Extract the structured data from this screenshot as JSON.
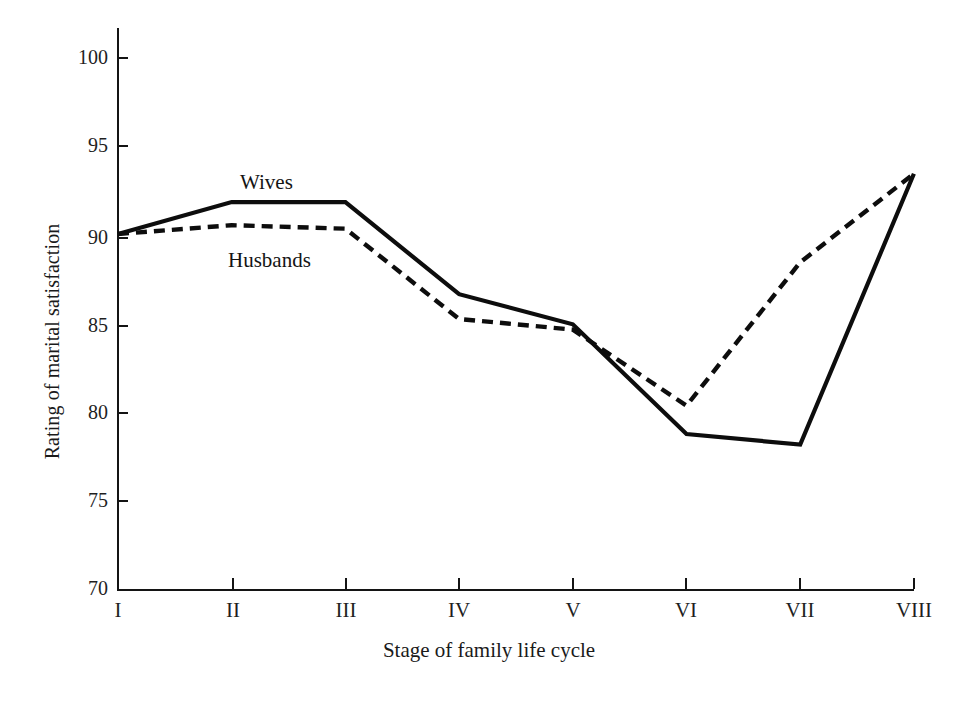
{
  "chart_data": {
    "type": "line",
    "title": "",
    "xlabel": "Stage of family life cycle",
    "ylabel": "Rating of marital satisfaction",
    "categories": [
      "I",
      "II",
      "III",
      "IV",
      "V",
      "VI",
      "VII",
      "VIII"
    ],
    "x_tick_labels": [
      "I",
      "II",
      "III",
      "IV",
      "V",
      "VI",
      "VII",
      "VIII"
    ],
    "y_tick_labels": [
      "100",
      "95",
      "90",
      "85",
      "80",
      "75",
      "70"
    ],
    "y_ticks": [
      100,
      95,
      90,
      85,
      80,
      75,
      70
    ],
    "ylim": [
      70,
      100
    ],
    "grid": false,
    "legend_position": "inline-labels",
    "series": [
      {
        "name": "Wives",
        "style": "solid",
        "color": "#0d0d0d",
        "values": [
          90.0,
          91.8,
          91.8,
          86.6,
          84.9,
          78.7,
          78.1,
          93.4
        ]
      },
      {
        "name": "Husbands",
        "style": "dashed",
        "color": "#0d0d0d",
        "values": [
          90.0,
          90.5,
          90.3,
          85.2,
          84.6,
          80.3,
          88.4,
          93.4
        ]
      }
    ],
    "annotations": [
      {
        "text": "Wives",
        "x_category": "II",
        "value": 91.8
      },
      {
        "text": "Husbands",
        "x_category": "II",
        "value": 90.5
      }
    ]
  },
  "axis": {
    "y_title": "Rating of marital satisfaction",
    "x_title": "Stage of family life cycle"
  },
  "series_labels": {
    "wives": "Wives",
    "husbands": "Husbands"
  },
  "y_tick_labels": {
    "t0": "100",
    "t1": "95",
    "t2": "90",
    "t3": "85",
    "t4": "80",
    "t5": "75",
    "t6": "70"
  },
  "x_tick_labels": {
    "t0": "I",
    "t1": "II",
    "t2": "III",
    "t3": "IV",
    "t4": "V",
    "t5": "VI",
    "t6": "VII",
    "t7": "VIII"
  },
  "colors": {
    "ink": "#0d0d0d",
    "axis": "#141414",
    "background": "#ffffff"
  }
}
